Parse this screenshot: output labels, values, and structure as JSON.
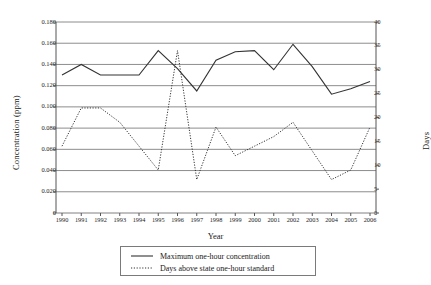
{
  "chart_data": {
    "type": "line",
    "title": "",
    "xlabel": "Year",
    "ylabel": "Concentration (ppm)",
    "ylabel_right": "Days",
    "grid": true,
    "legend_position": "bottom",
    "categories": [
      1990,
      1991,
      1992,
      1993,
      1994,
      1995,
      1996,
      1997,
      1998,
      1999,
      2000,
      2001,
      2002,
      2003,
      2004,
      2005,
      2006
    ],
    "xtick_labels": [
      "1990",
      "1991",
      "1992",
      "1993",
      "1994",
      "1995",
      "1996",
      "1997",
      "1998",
      "1999",
      "2000",
      "2001",
      "2002",
      "2003",
      "2004",
      "2005",
      "2006"
    ],
    "ylim": [
      0,
      0.18
    ],
    "ytick_labels": [
      "0.180",
      "0.160",
      "0.140",
      "0.120",
      "0.100",
      "0.080",
      "0.060",
      "0.040",
      "0.020",
      "0"
    ],
    "ytick_values": [
      0.18,
      0.16,
      0.14,
      0.12,
      0.1,
      0.08,
      0.06,
      0.04,
      0.02,
      0
    ],
    "ylim_right": [
      0,
      40
    ],
    "ytick_labels_right": [
      "40",
      "35",
      "30",
      "25",
      "20",
      "15",
      "10",
      "5",
      "0"
    ],
    "ytick_values_right": [
      40,
      35,
      30,
      25,
      20,
      15,
      10,
      5,
      0
    ],
    "series": [
      {
        "name": "Maximum one-hour concentration",
        "axis": "left",
        "style": "solid",
        "color": "#333333",
        "unit": "ppm",
        "values": [
          0.13,
          0.14,
          0.13,
          0.13,
          0.13,
          0.153,
          0.136,
          0.115,
          0.144,
          0.152,
          0.153,
          0.135,
          0.159,
          0.138,
          0.112,
          0.117,
          0.124
        ]
      },
      {
        "name": "Days above state one-hour standard",
        "axis": "right",
        "style": "dotted",
        "color": "#333333",
        "unit": "days",
        "values": [
          14,
          22,
          22,
          19,
          14,
          9,
          34,
          7,
          18,
          12,
          14,
          16,
          19,
          13,
          7,
          9,
          18
        ]
      }
    ]
  },
  "legend": {
    "items": [
      {
        "label": "Maximum one-hour concentration",
        "style": "solid"
      },
      {
        "label": "Days above state one-hour standard",
        "style": "dotted"
      }
    ]
  }
}
